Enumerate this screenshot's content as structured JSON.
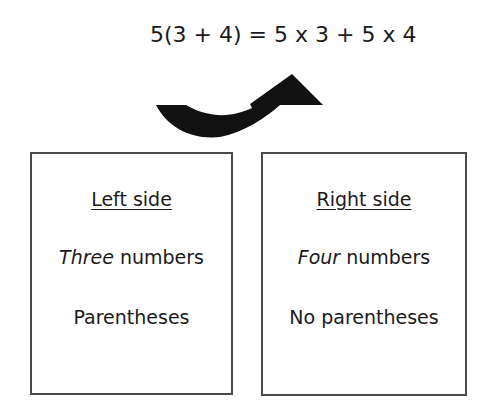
{
  "equation": "5(3 + 4) = 5 x 3 + 5 x 4",
  "arrow": {
    "icon": "curved-arrow-icon",
    "direction": "left-to-right-upward",
    "color": "#111111"
  },
  "boxes": {
    "left": {
      "heading": "Left side",
      "count_emphasis": "Three",
      "count_rest": " numbers",
      "parentheses": "Parentheses"
    },
    "right": {
      "heading": "Right side",
      "count_emphasis": "Four",
      "count_rest": " numbers",
      "parentheses": "No parentheses"
    }
  },
  "colors": {
    "text": "#1a1a1a",
    "border": "#4a4a4a",
    "background": "#ffffff"
  }
}
